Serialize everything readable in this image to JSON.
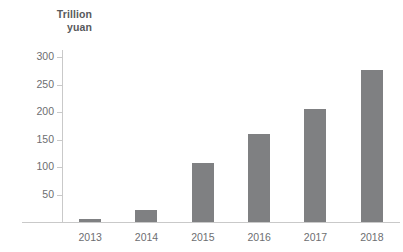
{
  "chart_data": {
    "type": "bar",
    "title": "",
    "subtitle": "",
    "xlabel": "",
    "ylabel": "Trillion yuan",
    "ylabel_lines": [
      "Trillion",
      "yuan"
    ],
    "categories": [
      "2013",
      "2014",
      "2015",
      "2016",
      "2017",
      "2018"
    ],
    "values": [
      5,
      22,
      108,
      160,
      205,
      276
    ],
    "series": [
      {
        "name": "Value",
        "values": [
          5,
          22,
          108,
          160,
          205,
          276
        ]
      }
    ],
    "ylim": [
      0,
      300
    ],
    "y_ticks": [
      50,
      100,
      150,
      200,
      250,
      300
    ],
    "y_tick_labels": [
      "50",
      "100",
      "150",
      "200",
      "250",
      "300"
    ],
    "grid": false,
    "legend": false,
    "legend_position": "none",
    "bar_color": "#7f8082",
    "axis_color": "#c9c9c9",
    "text_color": "#6d6e71",
    "background": "#ffffff"
  }
}
